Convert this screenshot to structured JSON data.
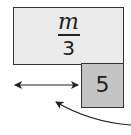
{
  "diagram": {
    "top_block": {
      "numerator": "m",
      "denominator": "3",
      "fill": "#ebebeb"
    },
    "bottom_block": {
      "label": "5",
      "fill": "#c4c4c4"
    },
    "arrows": [
      {
        "type": "double-headed",
        "from": [
          13,
          85
        ],
        "to": [
          80,
          85
        ]
      },
      {
        "type": "curved",
        "from": [
          130,
          125
        ],
        "to": [
          53,
          101
        ]
      }
    ]
  }
}
